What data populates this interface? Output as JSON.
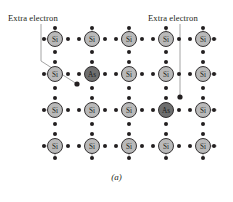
{
  "figure": {
    "caption": "(a)",
    "annotations": [
      {
        "id": "extra-electron-left",
        "text": "Extra electron"
      },
      {
        "id": "extra-electron-right",
        "text": "Extra electron"
      }
    ],
    "colors": {
      "silicon_fill": "#b9b9b9",
      "arsenic_fill": "#6e6e6e",
      "atom_stroke": "#231f20",
      "electron": "#231f20",
      "leader_line": "#9a9a9a",
      "background": "#ffffff",
      "text": "#231f20"
    },
    "lattice": {
      "type": "crystal-lattice-diagram",
      "rows": 4,
      "columns": 5,
      "column_x": [
        55,
        92,
        129,
        166,
        203
      ],
      "row_y": [
        39,
        74,
        110,
        146
      ],
      "atom_radius": 7.5,
      "bond_dot_radius": 2.0,
      "grid": [
        [
          "Si",
          "Si",
          "Si",
          "Si",
          "Si"
        ],
        [
          "Si",
          "As",
          "Si",
          "Si",
          "Si"
        ],
        [
          "Si",
          "Si",
          "Si",
          "As",
          "Si"
        ],
        [
          "Si",
          "Si",
          "Si",
          "Si",
          "Si"
        ]
      ],
      "dopants": [
        {
          "label": "As",
          "row": 1,
          "column": 1
        },
        {
          "label": "As",
          "row": 2,
          "column": 3
        }
      ],
      "free_electrons": [
        {
          "x": 77,
          "y": 84,
          "belongs_to": "As-row1-col1"
        },
        {
          "x": 180,
          "y": 97,
          "belongs_to": "As-row2-col3"
        }
      ]
    }
  }
}
